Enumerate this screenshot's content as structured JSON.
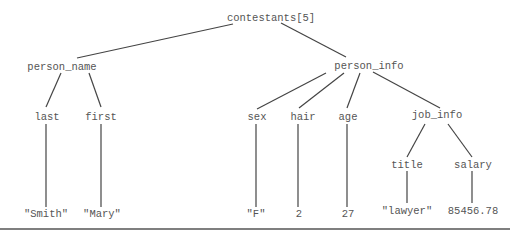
{
  "diagram": {
    "type": "tree",
    "line_color": "#444444",
    "text_color": "#555555",
    "nodes": {
      "root": "contestants[5]",
      "person_name": "person_name",
      "person_info": "person_info",
      "last": "last",
      "first": "first",
      "sex": "sex",
      "hair": "hair",
      "age": "age",
      "job_info": "job_info",
      "title": "title",
      "salary": "salary",
      "val_last": "\"Smith\"",
      "val_first": "\"Mary\"",
      "val_sex": "\"F\"",
      "val_hair": "2",
      "val_age": "27",
      "val_title": "\"lawyer\"",
      "val_salary": "85456.78"
    },
    "edges": [
      [
        "root",
        "person_name"
      ],
      [
        "root",
        "person_info"
      ],
      [
        "person_name",
        "last"
      ],
      [
        "person_name",
        "first"
      ],
      [
        "person_info",
        "sex"
      ],
      [
        "person_info",
        "hair"
      ],
      [
        "person_info",
        "age"
      ],
      [
        "person_info",
        "job_info"
      ],
      [
        "job_info",
        "title"
      ],
      [
        "job_info",
        "salary"
      ],
      [
        "last",
        "val_last"
      ],
      [
        "first",
        "val_first"
      ],
      [
        "sex",
        "val_sex"
      ],
      [
        "hair",
        "val_hair"
      ],
      [
        "age",
        "val_age"
      ],
      [
        "title",
        "val_title"
      ],
      [
        "salary",
        "val_salary"
      ]
    ]
  }
}
